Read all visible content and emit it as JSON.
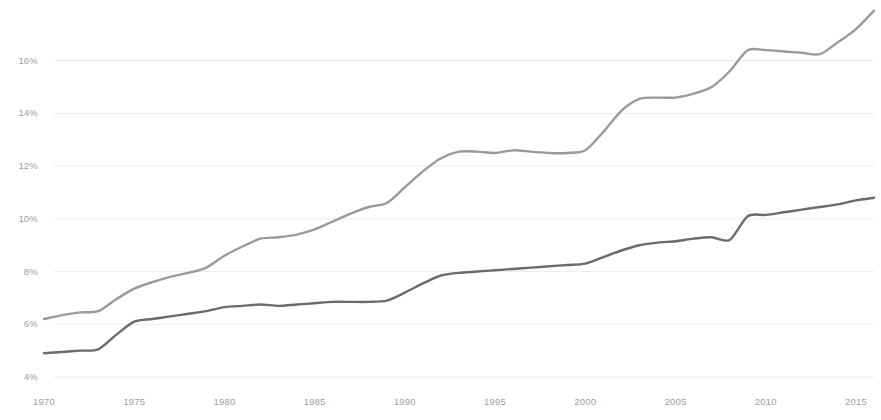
{
  "chart_data": {
    "type": "line",
    "title": "",
    "subtitle": "",
    "xlabel": "",
    "ylabel": "",
    "xlim": [
      1970,
      2016
    ],
    "ylim": [
      4,
      18
    ],
    "grid": true,
    "grid_axis": "y",
    "legend": "none",
    "y_tick_labels": [
      "16%",
      "14%",
      "12%",
      "10%",
      "8%",
      "6%",
      "4%"
    ],
    "y_ticks": [
      16,
      14,
      12,
      10,
      8,
      6,
      4
    ],
    "x_tick_labels": [
      "1970",
      "1975",
      "1980",
      "1985",
      "1990",
      "1995",
      "2000",
      "2005",
      "2010",
      "2015"
    ],
    "x_ticks": [
      1970,
      1975,
      1980,
      1985,
      1990,
      1995,
      2000,
      2005,
      2010,
      2015
    ],
    "x": [
      1970,
      1971,
      1972,
      1973,
      1974,
      1975,
      1976,
      1977,
      1978,
      1979,
      1980,
      1981,
      1982,
      1983,
      1984,
      1985,
      1986,
      1987,
      1988,
      1989,
      1990,
      1991,
      1992,
      1993,
      1994,
      1995,
      1996,
      1997,
      1998,
      1999,
      2000,
      2001,
      2002,
      2003,
      2004,
      2005,
      2006,
      2007,
      2008,
      2009,
      2010,
      2011,
      2012,
      2013,
      2014,
      2015,
      2016
    ],
    "series": [
      {
        "name": "upper-line",
        "color": "#9a9a9a",
        "line_width": 2.4,
        "values": [
          6.2,
          6.35,
          6.45,
          6.5,
          6.95,
          7.35,
          7.6,
          7.8,
          7.95,
          8.15,
          8.6,
          8.95,
          9.25,
          9.3,
          9.4,
          9.6,
          9.9,
          10.2,
          10.45,
          10.6,
          11.2,
          11.8,
          12.3,
          12.55,
          12.55,
          12.5,
          12.6,
          12.55,
          12.5,
          12.5,
          12.6,
          13.3,
          14.1,
          14.55,
          14.6,
          14.6,
          14.75,
          15.0,
          15.6,
          16.4,
          16.4,
          16.35,
          16.3,
          16.25,
          16.7,
          17.2,
          17.9
        ]
      },
      {
        "name": "lower-line",
        "color": "#6b6b6b",
        "line_width": 2.4,
        "values": [
          4.9,
          4.95,
          5.0,
          5.05,
          5.6,
          6.1,
          6.2,
          6.3,
          6.4,
          6.5,
          6.65,
          6.7,
          6.75,
          6.7,
          6.75,
          6.8,
          6.85,
          6.85,
          6.85,
          6.9,
          7.2,
          7.55,
          7.85,
          7.95,
          8.0,
          8.05,
          8.1,
          8.15,
          8.2,
          8.25,
          8.3,
          8.55,
          8.8,
          9.0,
          9.1,
          9.15,
          9.25,
          9.3,
          9.2,
          10.1,
          10.15,
          10.25,
          10.35,
          10.45,
          10.55,
          10.7,
          10.8
        ]
      }
    ]
  },
  "grid": {
    "color": "#ececec"
  },
  "axis": {
    "tick_color": "#9d9d9d"
  }
}
